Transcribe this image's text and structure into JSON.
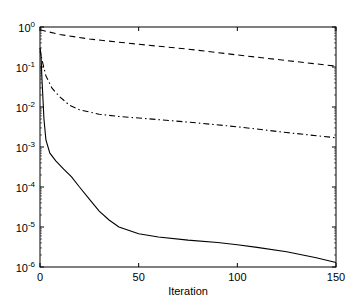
{
  "chart_data": {
    "type": "line",
    "title": "",
    "xlabel": "Iteration",
    "ylabel": "",
    "xlim": [
      0,
      150
    ],
    "ylim": [
      1e-06,
      1
    ],
    "yscale": "log",
    "grid": false,
    "legend": null,
    "x_ticks": [
      0,
      50,
      100,
      150
    ],
    "y_ticks": [
      {
        "exp": "0",
        "value": 1
      },
      {
        "exp": "-1",
        "value": 0.1
      },
      {
        "exp": "-2",
        "value": 0.01
      },
      {
        "exp": "-3",
        "value": 0.001
      },
      {
        "exp": "-4",
        "value": 0.0001
      },
      {
        "exp": "-5",
        "value": 1e-05
      },
      {
        "exp": "-6",
        "value": 1e-06
      }
    ],
    "series": [
      {
        "name": "dashed",
        "style": "dashed",
        "x": [
          0,
          10,
          25,
          50,
          75,
          100,
          125,
          150
        ],
        "y": [
          0.85,
          0.65,
          0.5,
          0.37,
          0.28,
          0.2,
          0.145,
          0.105
        ]
      },
      {
        "name": "dash-dot",
        "style": "dashdot",
        "x": [
          0,
          1,
          3,
          6,
          10,
          15,
          20,
          30,
          40,
          50,
          75,
          100,
          125,
          150
        ],
        "y": [
          0.3,
          0.15,
          0.06,
          0.03,
          0.018,
          0.011,
          0.0085,
          0.0066,
          0.0058,
          0.0053,
          0.0042,
          0.0032,
          0.0023,
          0.0017
        ]
      },
      {
        "name": "solid",
        "style": "solid",
        "x": [
          0,
          0.5,
          1,
          2,
          3,
          5,
          8,
          12,
          16,
          20,
          25,
          30,
          35,
          40,
          50,
          60,
          75,
          90,
          100,
          110,
          125,
          140,
          150
        ],
        "y": [
          0.25,
          0.2,
          0.05,
          0.005,
          0.0015,
          0.0007,
          0.00045,
          0.00028,
          0.00018,
          0.0001,
          5e-05,
          2.5e-05,
          1.5e-05,
          1e-05,
          6.8e-06,
          5.6e-06,
          4.7e-06,
          4.1e-06,
          3.6e-06,
          3.1e-06,
          2.4e-06,
          1.7e-06,
          1.3e-06
        ]
      }
    ]
  }
}
